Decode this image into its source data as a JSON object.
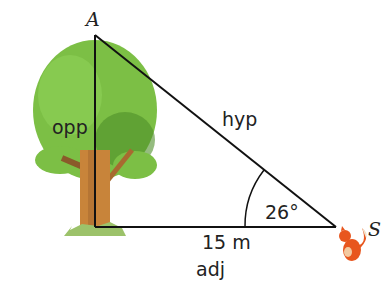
{
  "diagram": {
    "vertices": {
      "top": "A",
      "right": "S"
    },
    "sides": {
      "opposite": "opp",
      "hypotenuse": "hyp",
      "adjacent_value": "15 m",
      "adjacent": "adj"
    },
    "angle": "26°",
    "colors": {
      "line": "#111111",
      "leaf": "#7cbf45",
      "leaf_dark": "#4f8f2a",
      "trunk": "#c8843a",
      "grass": "#9cc26a",
      "fox": "#e8561e"
    }
  }
}
